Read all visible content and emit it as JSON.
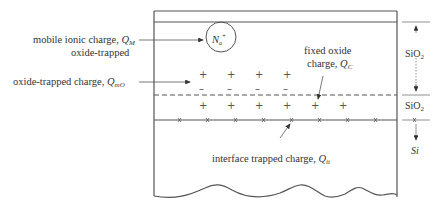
{
  "diagram": {
    "labels": {
      "mobile_ionic": {
        "text": "mobile ionic charge, ",
        "symbol": "Q",
        "subscript": "M"
      },
      "oxide_trapped_line1": "oxide-trapped",
      "oxide_trapped": {
        "text": "oxide-trapped charge, ",
        "symbol": "Q",
        "subscript": "mO"
      },
      "fixed_oxide_line1": "fixed oxide",
      "fixed_oxide": {
        "text": "charge, ",
        "symbol": "Q",
        "subscript": "C"
      },
      "interface_trapped": {
        "text": "interface trapped charge, ",
        "symbol": "Q",
        "subscript": "it"
      },
      "ion": {
        "symbol": "N",
        "subscript": "a",
        "superscript": "+"
      }
    },
    "regions": [
      {
        "name": "SiO",
        "subscript": "2",
        "id": "sio2-upper"
      },
      {
        "name": "SiO",
        "subscript": "2",
        "id": "sio2-lower"
      },
      {
        "name": "Si",
        "id": "si"
      }
    ],
    "charge_marks": {
      "oxide_trapped_plus_count": 4,
      "oxide_trapped_minus_count": 4,
      "fixed_plus_count": 6,
      "interface_x_count": 8,
      "plus_symbol": "+",
      "minus_symbol": "–"
    },
    "colors": {
      "line": "#555555",
      "text": "#333333",
      "background": "#ffffff"
    }
  }
}
